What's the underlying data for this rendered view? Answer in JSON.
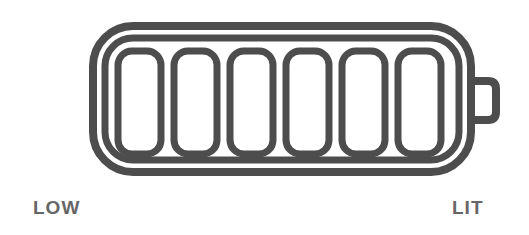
{
  "diagram": {
    "stroke_color": "#4d4d4d",
    "label_color": "#666666",
    "cell_count": 6,
    "labels": {
      "low": "LOW",
      "lit": "LIT"
    }
  }
}
